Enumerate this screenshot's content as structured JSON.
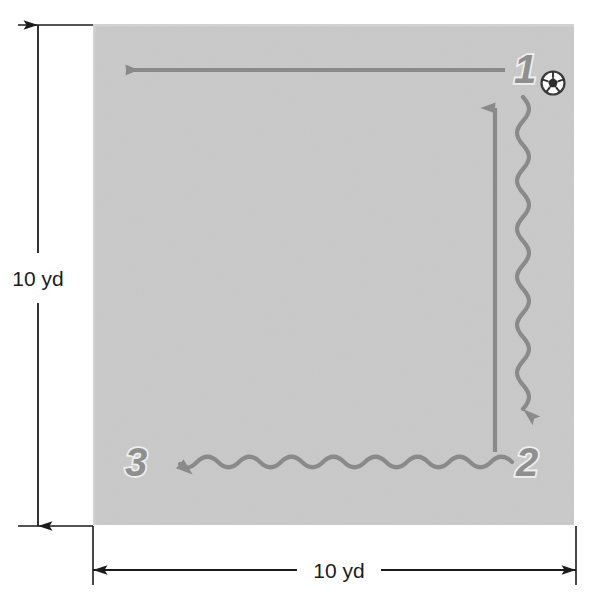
{
  "figure": {
    "type": "soccer-drill-diagram",
    "title_visible": false,
    "field": {
      "shape": "square",
      "fill_color": "#c9c9c9",
      "width_label": "10 yd",
      "height_label": "10 yd"
    },
    "dimensions": {
      "vertical": {
        "label": "10 yd",
        "value": 10,
        "unit": "yd"
      },
      "horizontal": {
        "label": "10 yd",
        "value": 10,
        "unit": "yd"
      }
    },
    "steps": [
      {
        "id": "1",
        "label": "1",
        "movement": "dribble",
        "direction": "down",
        "note": "start with ball"
      },
      {
        "id": "2",
        "label": "2",
        "movement": "dribble",
        "direction": "left"
      },
      {
        "id": "3",
        "label": "3",
        "movement": "run",
        "direction": "up-then-left"
      }
    ],
    "paths": [
      {
        "name": "run-left-top",
        "style": "straight",
        "direction": "left",
        "color": "#8a8a8a"
      },
      {
        "name": "run-up-right",
        "style": "straight",
        "direction": "up",
        "color": "#8a8a8a"
      },
      {
        "name": "dribble-down-right",
        "style": "wavy",
        "direction": "down",
        "color": "#8a8a8a"
      },
      {
        "name": "dribble-left-bottom",
        "style": "wavy",
        "direction": "left",
        "color": "#8a8a8a"
      }
    ],
    "ball": {
      "name": "soccer-ball",
      "visible": true
    },
    "colors": {
      "field": "#c9c9c9",
      "path": "#8a8a8a",
      "numeral_fill": "#8f8f8f",
      "numeral_outline": "#efefef",
      "dimension_line": "#1b1b1b",
      "background": "#ffffff"
    }
  }
}
